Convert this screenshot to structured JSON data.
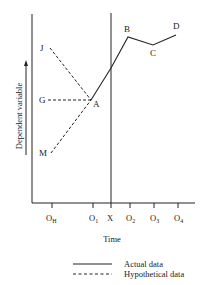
{
  "figure": {
    "y_axis_label": "Dependent variable",
    "x_axis_label": "Time",
    "x_ticks": [
      {
        "main": "O",
        "sub": "H"
      },
      {
        "main": "O",
        "sub": "1"
      },
      {
        "main": "X",
        "sub": ""
      },
      {
        "main": "O",
        "sub": "2"
      },
      {
        "main": "O",
        "sub": "3"
      },
      {
        "main": "O",
        "sub": "4"
      }
    ],
    "points": {
      "J": "J",
      "G": "G",
      "A": "A",
      "M": "M",
      "B": "B",
      "C": "C",
      "D": "D"
    },
    "actual_series": [
      "A",
      "B",
      "C",
      "D"
    ],
    "hypothetical_series": [
      [
        "J",
        "A"
      ],
      [
        "G",
        "A"
      ],
      [
        "M",
        "A"
      ]
    ],
    "legend": {
      "actual": "Actual data",
      "hypothetical": "Hypothetical data"
    }
  }
}
